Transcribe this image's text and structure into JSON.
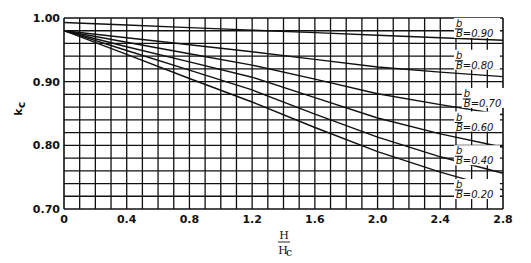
{
  "chart_data": {
    "type": "line",
    "title": "",
    "xlabel": "H/Hc",
    "xlabel_num": "H",
    "xlabel_den": "Hc",
    "ylabel": "kc",
    "xlim": [
      0,
      2.8
    ],
    "ylim": [
      0.7,
      1.0
    ],
    "xticks": [
      0,
      0.4,
      0.8,
      1.2,
      1.6,
      2.0,
      2.4,
      2.8
    ],
    "xtick_labels": [
      "0",
      "0.4",
      "0.8",
      "1.2",
      "1.6",
      "2.0",
      "2.4",
      "2.8"
    ],
    "yticks": [
      0.7,
      0.8,
      0.9,
      1.0
    ],
    "ytick_labels": [
      "0.70",
      "0.80",
      "0.90",
      "1.00"
    ],
    "grid": {
      "on": true,
      "x_step": 0.1,
      "y_step": 0.02
    },
    "legend_position": "inline-right",
    "x": [
      0,
      0.4,
      0.8,
      1.2,
      1.6,
      2.0,
      2.4,
      2.8
    ],
    "series": [
      {
        "name": "b/B=0.90",
        "label": "b/B=0.90",
        "values": [
          0.993,
          0.989,
          0.985,
          0.981,
          0.977,
          0.973,
          0.969,
          0.965
        ]
      },
      {
        "name": "b/B=0.80",
        "label": "b/B=0.80",
        "values": [
          0.98,
          0.969,
          0.958,
          0.947,
          0.935,
          0.923,
          0.915,
          0.908
        ]
      },
      {
        "name": "b/B=0.70",
        "label": "b/B=0.70",
        "values": [
          0.98,
          0.962,
          0.944,
          0.926,
          0.904,
          0.881,
          0.864,
          0.848
        ]
      },
      {
        "name": "b/B=0.60",
        "label": "b/B=0.60",
        "values": [
          0.98,
          0.955,
          0.931,
          0.907,
          0.875,
          0.843,
          0.818,
          0.797
        ]
      },
      {
        "name": "b/B=0.40",
        "label": "b/B=0.40",
        "values": [
          0.98,
          0.949,
          0.918,
          0.887,
          0.849,
          0.813,
          0.782,
          0.756
        ]
      },
      {
        "name": "b/B=0.20",
        "label": "b/B=0.20",
        "values": [
          0.98,
          0.943,
          0.905,
          0.868,
          0.828,
          0.79,
          0.758,
          0.73
        ]
      }
    ],
    "label_anchor_y": {
      "b/B=0.90": 0.975,
      "b/B=0.80": 0.925,
      "b/B=0.70": 0.865,
      "b/B=0.60": 0.828,
      "b/B=0.40": 0.775,
      "b/B=0.20": 0.722
    },
    "label_anchor_x": {
      "b/B=0.90": 2.5,
      "b/B=0.80": 2.5,
      "b/B=0.70": 2.55,
      "b/B=0.60": 2.5,
      "b/B=0.40": 2.5,
      "b/B=0.20": 2.5
    },
    "colors": {
      "line": "#111111",
      "grid": "#111111",
      "background": "#ffffff"
    }
  }
}
